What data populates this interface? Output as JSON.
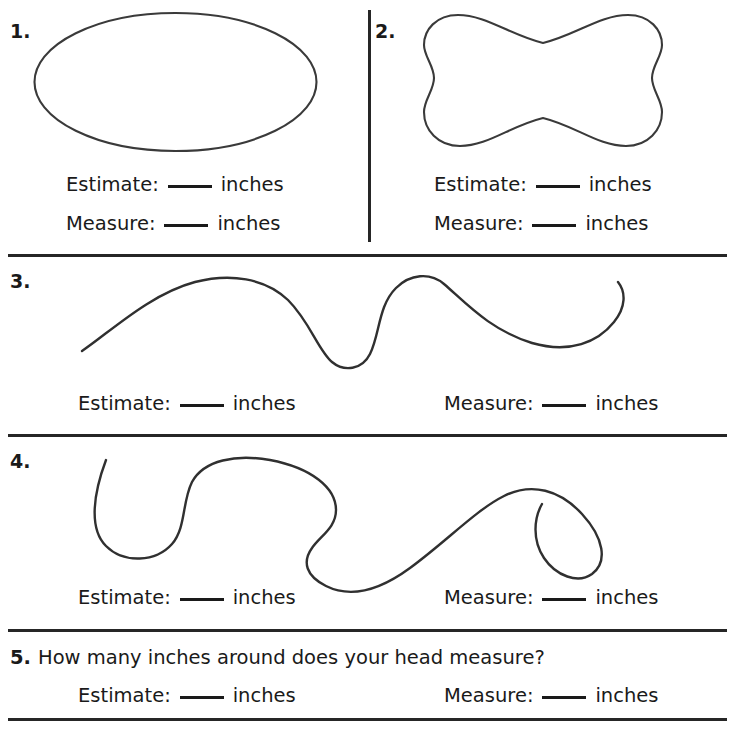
{
  "worksheet": {
    "width": 735,
    "height": 733,
    "background_color": "#ffffff",
    "ink_color": "#1a1a1a",
    "shape_stroke_color": "#3a3a3a",
    "rule_color": "#262626"
  },
  "labels": {
    "estimate": "Estimate:",
    "measure": "Measure:",
    "inches": "inches",
    "blank": "____"
  },
  "problems": [
    {
      "number": "1.",
      "figure": "ellipse-shape",
      "figure_description": "large horizontal oval outline",
      "rows": [
        {
          "label": "Estimate:",
          "unit": "inches"
        },
        {
          "label": "Measure:",
          "unit": "inches"
        }
      ]
    },
    {
      "number": "2.",
      "figure": "bowtie-shape",
      "figure_description": "rounded bowtie / dog-bone outline",
      "rows": [
        {
          "label": "Estimate:",
          "unit": "inches"
        },
        {
          "label": "Measure:",
          "unit": "inches"
        }
      ]
    },
    {
      "number": "3.",
      "figure": "wavy-curve-one",
      "figure_description": "open wavy curve with one broad hill, a deep valley, a tall peak and a hooked right end",
      "rows": [
        {
          "label": "Estimate:",
          "unit": "inches"
        },
        {
          "label": "Measure:",
          "unit": "inches"
        }
      ]
    },
    {
      "number": "4.",
      "figure": "wavy-curve-two",
      "figure_description": "open looping curve with a deep U on the left, a broad hump, a valley and a hooked right end",
      "rows": [
        {
          "label": "Estimate:",
          "unit": "inches"
        },
        {
          "label": "Measure:",
          "unit": "inches"
        }
      ]
    },
    {
      "number": "5.",
      "question": "How many inches around does your head measure?",
      "rows": [
        {
          "label": "Estimate:",
          "unit": "inches"
        },
        {
          "label": "Measure:",
          "unit": "inches"
        }
      ]
    }
  ]
}
